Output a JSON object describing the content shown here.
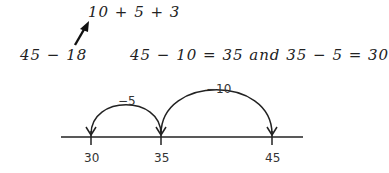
{
  "expressions": {
    "top": "10 + 5 + 3",
    "left": "45 − 18",
    "right": "45 − 10 = 35 and 35 − 5 = 30"
  },
  "number_line": {
    "ticks": [
      {
        "value": "30",
        "x": 91
      },
      {
        "value": "35",
        "x": 161
      },
      {
        "value": "45",
        "x": 272
      }
    ],
    "jumps": [
      {
        "label": "−10",
        "from": "45",
        "to": "35"
      },
      {
        "label": "−5",
        "from": "35",
        "to": "30"
      }
    ]
  }
}
